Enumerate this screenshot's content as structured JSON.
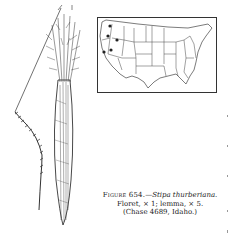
{
  "figure": {
    "label": "Figure 654.",
    "dash": "—",
    "species": "Stipa thurberiana.",
    "line2": "Floret, × 1; lemma, × 5.",
    "line3": "(Chase 4689, Idaho.)"
  },
  "map": {
    "region": "United States",
    "marker_states": [
      "Washington",
      "Oregon",
      "Idaho",
      "California",
      "Nevada"
    ]
  },
  "illustration": {
    "subjects": [
      "floret",
      "lemma"
    ]
  }
}
